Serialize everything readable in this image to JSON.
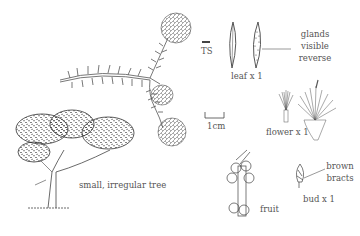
{
  "labels": {
    "ts": "TS",
    "leaf": "leaf x 1",
    "glands_1": "glands",
    "glands_2": "visible",
    "glands_3": "reverse",
    "scale": "1cm",
    "flower": "flower x 1",
    "tree": "small, irregular tree",
    "fruit": "fruit",
    "bud": "bud x 1",
    "bracts_1": "brown",
    "bracts_2": "bracts"
  },
  "colors": {
    "ink": "#333333",
    "background": "#ffffff"
  },
  "illustrations": [
    "flowering-branch",
    "leaf-transverse-section",
    "leaf-front",
    "leaf-reverse-with-glands",
    "scale-bar",
    "single-flower",
    "flower-cluster-section",
    "tree-habit",
    "fruit-stem",
    "bud"
  ]
}
